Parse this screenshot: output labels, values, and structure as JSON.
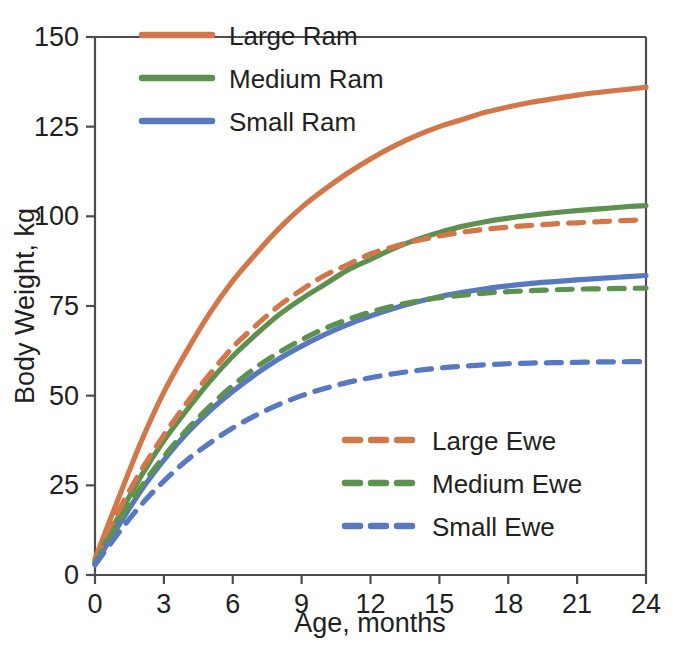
{
  "chart_data": {
    "type": "line",
    "title": "",
    "xlabel": "Age, months",
    "ylabel": "Body Weight, kg",
    "xlim": [
      0,
      24
    ],
    "ylim": [
      0,
      150
    ],
    "xticks": [
      0,
      3,
      6,
      9,
      12,
      15,
      18,
      21,
      24
    ],
    "yticks": [
      0,
      25,
      50,
      75,
      100,
      125,
      150
    ],
    "grid": false,
    "x": [
      0,
      1,
      2,
      3,
      4,
      5,
      6,
      7,
      8,
      9,
      10,
      11,
      12,
      13,
      14,
      15,
      16,
      17,
      18,
      19,
      20,
      21,
      22,
      23,
      24
    ],
    "series": [
      {
        "name": "Large Ram",
        "color": "#d2774a",
        "style": "solid",
        "legend": "upper-left",
        "asymptote": 136,
        "values": [
          4.5,
          21.0,
          37.0,
          51.0,
          62.5,
          73.0,
          82.0,
          89.5,
          96.5,
          102.5,
          107.5,
          112.0,
          116.0,
          119.5,
          122.5,
          125.0,
          127.0,
          129.0,
          130.5,
          131.8,
          132.8,
          133.8,
          134.6,
          135.3,
          136.0
        ]
      },
      {
        "name": "Medium Ram",
        "color": "#5d9150",
        "style": "solid",
        "legend": "upper-left",
        "asymptote": 103,
        "values": [
          3.5,
          16.0,
          27.5,
          37.5,
          46.0,
          54.0,
          61.0,
          67.0,
          72.5,
          77.0,
          81.0,
          85.0,
          88.0,
          91.0,
          93.5,
          95.5,
          97.2,
          98.5,
          99.5,
          100.3,
          101.0,
          101.6,
          102.1,
          102.6,
          103.0
        ]
      },
      {
        "name": "Small Ram",
        "color": "#5878c0",
        "style": "solid",
        "legend": "upper-left",
        "asymptote": 83.5,
        "values": [
          3.0,
          13.5,
          23.5,
          32.0,
          39.5,
          45.8,
          51.2,
          56.0,
          60.2,
          63.8,
          67.0,
          69.8,
          72.2,
          74.3,
          76.1,
          77.6,
          78.8,
          79.8,
          80.6,
          81.3,
          81.8,
          82.3,
          82.7,
          83.1,
          83.5
        ]
      },
      {
        "name": "Large Ewe",
        "color": "#d2774a",
        "style": "dashed",
        "legend": "lower-right",
        "asymptote": 99,
        "values": [
          4.0,
          17.5,
          29.0,
          39.0,
          48.0,
          56.0,
          63.5,
          69.5,
          75.0,
          79.5,
          83.5,
          86.5,
          89.5,
          91.5,
          93.2,
          94.5,
          95.6,
          96.4,
          97.0,
          97.5,
          97.9,
          98.2,
          98.5,
          98.8,
          99.0
        ]
      },
      {
        "name": "Medium Ewe",
        "color": "#5d9150",
        "style": "dashed",
        "legend": "lower-right",
        "asymptote": 80,
        "values": [
          3.3,
          14.5,
          24.5,
          33.0,
          40.5,
          47.0,
          52.8,
          57.8,
          62.0,
          65.6,
          68.7,
          71.2,
          73.3,
          75.0,
          76.3,
          77.3,
          78.0,
          78.6,
          79.0,
          79.3,
          79.5,
          79.7,
          79.8,
          79.9,
          80.0
        ]
      },
      {
        "name": "Small Ewe",
        "color": "#5878c0",
        "style": "dashed",
        "legend": "lower-right",
        "asymptote": 59.5,
        "values": [
          2.8,
          11.5,
          19.5,
          26.2,
          32.0,
          36.8,
          41.0,
          44.5,
          47.5,
          50.0,
          52.0,
          53.7,
          55.0,
          56.1,
          57.0,
          57.7,
          58.2,
          58.6,
          58.9,
          59.1,
          59.2,
          59.3,
          59.4,
          59.45,
          59.5
        ]
      }
    ],
    "legends": [
      {
        "position": "upper-left",
        "entries": [
          {
            "label": "Large Ram",
            "color": "#d2774a",
            "style": "solid"
          },
          {
            "label": "Medium Ram",
            "color": "#5d9150",
            "style": "solid"
          },
          {
            "label": "Small Ram",
            "color": "#5878c0",
            "style": "solid"
          }
        ]
      },
      {
        "position": "lower-right",
        "entries": [
          {
            "label": "Large Ewe",
            "color": "#d2774a",
            "style": "dashed"
          },
          {
            "label": "Medium Ewe",
            "color": "#5d9150",
            "style": "dashed"
          },
          {
            "label": "Small Ewe",
            "color": "#5878c0",
            "style": "dashed"
          }
        ]
      }
    ]
  },
  "axes": {
    "y_tick_labels": [
      "150",
      "125",
      "100",
      "75",
      "50",
      "25",
      "0"
    ],
    "x_tick_labels": [
      "0",
      "3",
      "6",
      "9",
      "12",
      "15",
      "18",
      "21",
      "24"
    ],
    "y_title": "Body Weight, kg",
    "x_title": "Age, months"
  },
  "legend_upper": {
    "item0": "Large Ram",
    "item1": "Medium Ram",
    "item2": "Small Ram"
  },
  "legend_lower": {
    "item0": "Large Ewe",
    "item1": "Medium Ewe",
    "item2": "Small Ewe"
  },
  "colors": {
    "large": "#d2774a",
    "medium": "#5d9150",
    "small": "#5878c0",
    "axis": "#4d4d4f",
    "text": "#231f20",
    "background": "#ffffff"
  }
}
